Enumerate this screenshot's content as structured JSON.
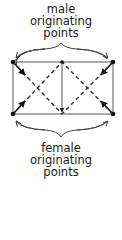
{
  "top_label": {
    "line1": "male",
    "line2": "originating",
    "line3": "points"
  },
  "bottom_label": {
    "line1": "female",
    "line2": "originating",
    "line3": "points"
  },
  "colors": {
    "stroke": "#444444",
    "dot": "#111111",
    "text": "#1a1a1a"
  }
}
